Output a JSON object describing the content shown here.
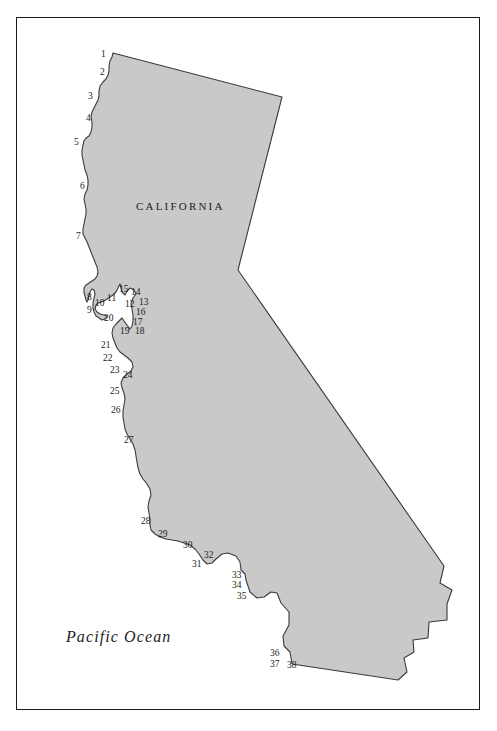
{
  "figure": {
    "type": "map",
    "region": "California",
    "frame": {
      "x": 16,
      "y": 17,
      "width": 464,
      "height": 693
    }
  },
  "colors": {
    "land_fill": "#c9c9c9",
    "land_stroke": "#3a3a3a",
    "ocean_fill": "#ffffff",
    "frame_stroke": "#1b1b1b",
    "label_text": "#1c1c1c"
  },
  "area_labels": {
    "state": "CALIFORNIA",
    "ocean": "Pacific Ocean"
  },
  "coastal_points": [
    {
      "id": "1",
      "label": "1",
      "x": 101,
      "y": 50
    },
    {
      "id": "2",
      "label": "2",
      "x": 100,
      "y": 68
    },
    {
      "id": "3",
      "label": "3",
      "x": 88,
      "y": 92
    },
    {
      "id": "4",
      "label": "4",
      "x": 86,
      "y": 114
    },
    {
      "id": "5",
      "label": "5",
      "x": 74,
      "y": 138
    },
    {
      "id": "6",
      "label": "6",
      "x": 80,
      "y": 182
    },
    {
      "id": "7",
      "label": "7",
      "x": 76,
      "y": 232
    },
    {
      "id": "8",
      "label": "8",
      "x": 87,
      "y": 293
    },
    {
      "id": "9",
      "label": "9",
      "x": 87,
      "y": 306
    },
    {
      "id": "10",
      "label": "10",
      "x": 95,
      "y": 299
    },
    {
      "id": "11",
      "label": "11",
      "x": 107,
      "y": 294
    },
    {
      "id": "12",
      "label": "12",
      "x": 125,
      "y": 300
    },
    {
      "id": "13",
      "label": "13",
      "x": 139,
      "y": 298
    },
    {
      "id": "14",
      "label": "14",
      "x": 131,
      "y": 288
    },
    {
      "id": "15",
      "label": "15",
      "x": 119,
      "y": 285
    },
    {
      "id": "16",
      "label": "16",
      "x": 136,
      "y": 308
    },
    {
      "id": "17",
      "label": "17",
      "x": 133,
      "y": 318
    },
    {
      "id": "18",
      "label": "18",
      "x": 135,
      "y": 327
    },
    {
      "id": "19",
      "label": "19",
      "x": 120,
      "y": 327
    },
    {
      "id": "20",
      "label": "20",
      "x": 104,
      "y": 314
    },
    {
      "id": "21",
      "label": "21",
      "x": 101,
      "y": 341
    },
    {
      "id": "22",
      "label": "22",
      "x": 103,
      "y": 354
    },
    {
      "id": "23",
      "label": "23",
      "x": 110,
      "y": 366
    },
    {
      "id": "24",
      "label": "24",
      "x": 123,
      "y": 371
    },
    {
      "id": "25",
      "label": "25",
      "x": 110,
      "y": 387
    },
    {
      "id": "26",
      "label": "26",
      "x": 111,
      "y": 406
    },
    {
      "id": "27",
      "label": "27",
      "x": 124,
      "y": 436
    },
    {
      "id": "28",
      "label": "28",
      "x": 141,
      "y": 517
    },
    {
      "id": "29",
      "label": "29",
      "x": 158,
      "y": 530
    },
    {
      "id": "30",
      "label": "30",
      "x": 183,
      "y": 541
    },
    {
      "id": "31",
      "label": "31",
      "x": 192,
      "y": 560
    },
    {
      "id": "32",
      "label": "32",
      "x": 204,
      "y": 551
    },
    {
      "id": "33",
      "label": "33",
      "x": 232,
      "y": 571
    },
    {
      "id": "34",
      "label": "34",
      "x": 232,
      "y": 581
    },
    {
      "id": "35",
      "label": "35",
      "x": 237,
      "y": 592
    },
    {
      "id": "36",
      "label": "36",
      "x": 270,
      "y": 649
    },
    {
      "id": "37",
      "label": "37",
      "x": 270,
      "y": 660
    },
    {
      "id": "38",
      "label": "38",
      "x": 287,
      "y": 661
    }
  ]
}
